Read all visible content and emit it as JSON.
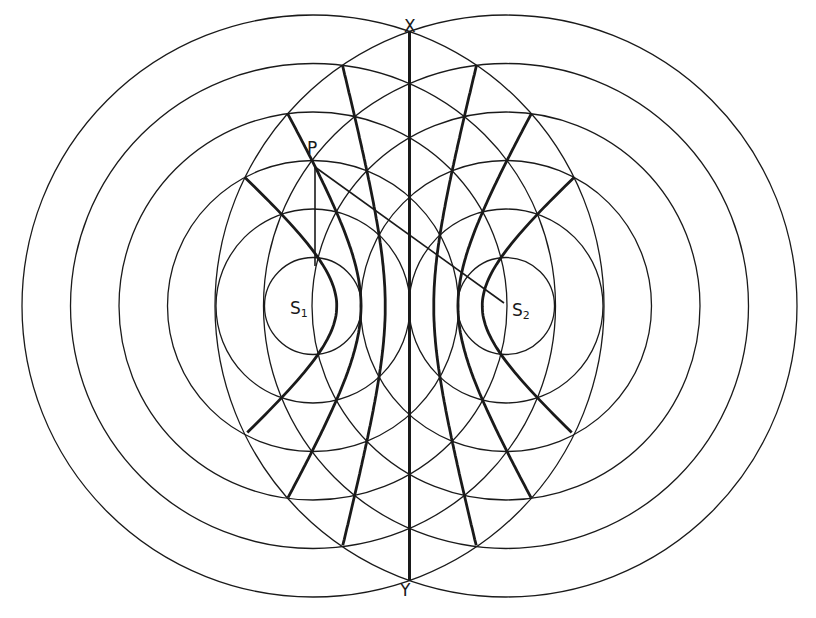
{
  "diagram": {
    "sources": [
      {
        "id": "S1",
        "label": "S",
        "sub": "1",
        "x": 313,
        "y": 306
      },
      {
        "id": "S2",
        "label": "S",
        "sub": "2",
        "x": 506,
        "y": 306
      }
    ],
    "wavelength": 48.5,
    "rings_per_source": 6,
    "hyperbola_orders": [
      1,
      2,
      3
    ],
    "labels": {
      "P": "P",
      "X": "X",
      "Y": "Y"
    },
    "point_P": {
      "x": 315,
      "y": 167
    },
    "colors": {
      "line": "#1a1a1a",
      "background": "#ffffff"
    }
  }
}
